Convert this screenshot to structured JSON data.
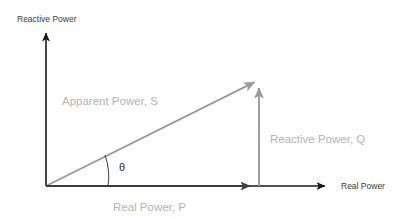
{
  "diagram": {
    "background_color": "#ffffff",
    "axes": {
      "vertical": {
        "label": "Reactive Power",
        "color": "#1a1a1a",
        "origin": [
          46,
          186
        ],
        "tip": [
          46,
          27
        ]
      },
      "horizontal": {
        "label": "Real Power",
        "color": "#1a1a1a",
        "origin": [
          46,
          186
        ],
        "tip": [
          332,
          186
        ]
      }
    },
    "vectors": [
      {
        "id": "apparent-power",
        "label": "Apparent Power, S",
        "symbol": "S",
        "color": "#9a9a9a",
        "from": [
          46,
          186
        ],
        "to": [
          262,
          78
        ],
        "label_pos": [
          62,
          102
        ]
      },
      {
        "id": "reactive-power",
        "label": "Reactive Power, Q",
        "symbol": "Q",
        "color": "#9a9a9a",
        "from": [
          259,
          186
        ],
        "to": [
          259,
          80
        ],
        "label_pos": [
          270,
          143
        ]
      },
      {
        "id": "real-power",
        "label": "Real Power, P",
        "symbol": "P",
        "color": "#3d3d3d",
        "from": [
          46,
          186
        ],
        "to": [
          258,
          186
        ],
        "label_pos": [
          113,
          210
        ]
      }
    ],
    "angle": {
      "symbol": "θ",
      "name": "phase-angle-theta",
      "color": "#2b2b2b",
      "vertex": [
        46,
        186
      ],
      "radius": 62,
      "label_pos": [
        122,
        170
      ]
    }
  }
}
